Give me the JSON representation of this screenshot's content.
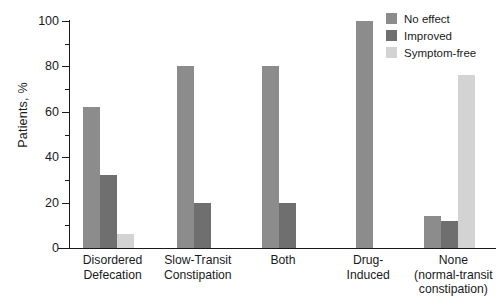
{
  "chart_data": {
    "type": "bar",
    "title": "",
    "xlabel": "",
    "ylabel": "Patients, %",
    "ylim": [
      0,
      100
    ],
    "ytick_major": [
      0,
      20,
      40,
      60,
      80,
      100
    ],
    "ytick_minor": [
      10,
      30,
      50,
      70,
      90
    ],
    "ytick_labels": [
      "0",
      "20",
      "40",
      "60",
      "80",
      "100"
    ],
    "grid": false,
    "legend_position": "top-right",
    "categories": [
      "Disordered Defecation",
      "Slow-Transit Constipation",
      "Both",
      "Drug-Induced",
      "None (normal-transit constipation)"
    ],
    "category_label_lines": [
      [
        "Disordered",
        "Defecation"
      ],
      [
        "Slow-Transit",
        "Constipation"
      ],
      [
        "Both"
      ],
      [
        "Drug-",
        "Induced"
      ],
      [
        "None",
        "(normal-transit",
        "constipation)"
      ]
    ],
    "series": [
      {
        "name": "No effect",
        "color": "#8c8c8c",
        "values": [
          62,
          80,
          80,
          100,
          14
        ]
      },
      {
        "name": "Improved",
        "color": "#6f6f6f",
        "values": [
          32,
          20,
          20,
          null,
          12
        ]
      },
      {
        "name": "Symptom-free",
        "color": "#d3d3d3",
        "values": [
          6,
          null,
          null,
          null,
          76
        ]
      }
    ]
  },
  "legend": {
    "items": [
      {
        "label": "No effect"
      },
      {
        "label": "Improved"
      },
      {
        "label": "Symptom-free"
      }
    ]
  },
  "axes": {
    "y_title": "Patients, %"
  }
}
